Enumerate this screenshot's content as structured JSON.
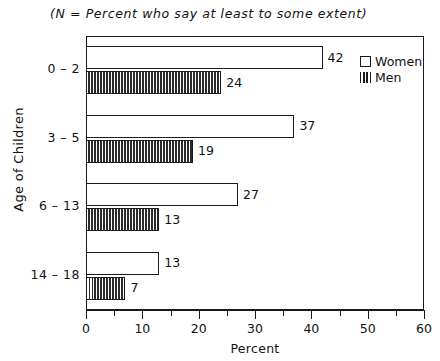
{
  "header": {
    "note": "(N  =  Percent who say at least to some extent)"
  },
  "legend": {
    "position": "top-right",
    "items": [
      {
        "label": "Women",
        "marker": "open-square-icon"
      },
      {
        "label": "Men",
        "marker": "vertical-hatch-icon"
      }
    ]
  },
  "axes": {
    "x": {
      "title": "Percent",
      "min": 0,
      "max": 60,
      "major_ticks": [
        0,
        10,
        20,
        30,
        40,
        50,
        60
      ],
      "minor_ticks": [
        5,
        15,
        25,
        35,
        45,
        55
      ],
      "tick_labels": [
        "0",
        "10",
        "20",
        "30",
        "40",
        "50",
        "60"
      ]
    },
    "y": {
      "title": "Age of Children",
      "categories": [
        "0 – 2",
        "3 – 5",
        "6 – 13",
        "14 – 18"
      ]
    }
  },
  "chart_data": {
    "type": "bar",
    "orientation": "horizontal",
    "title": "",
    "subtitle": "(N  =  Percent who say at least to some extent)",
    "xlabel": "Percent",
    "ylabel": "Age of Children",
    "xlim": [
      0,
      60
    ],
    "grid": false,
    "legend_position": "top-right",
    "categories": [
      "0 – 2",
      "3 – 5",
      "6 – 13",
      "14 – 18"
    ],
    "series": [
      {
        "name": "Women",
        "values": [
          42,
          37,
          27,
          13
        ]
      },
      {
        "name": "Men",
        "values": [
          24,
          19,
          13,
          7
        ]
      }
    ],
    "data_labels": {
      "Women": [
        "42",
        "37",
        "27",
        "13"
      ],
      "Men": [
        "24",
        "19",
        "13",
        "7"
      ]
    }
  }
}
